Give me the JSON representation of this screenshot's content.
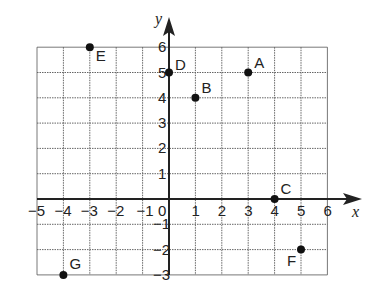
{
  "chart_data": {
    "type": "scatter",
    "title": "",
    "xlabel": "x",
    "ylabel": "y",
    "xlim": [
      -5,
      6
    ],
    "ylim": [
      -3,
      6
    ],
    "grid": true,
    "x_ticks": [
      "-5",
      "-4",
      "-3",
      "-2",
      "-1",
      "0",
      "1",
      "2",
      "3",
      "4",
      "5",
      "6"
    ],
    "y_ticks": [
      "6",
      "5",
      "4",
      "3",
      "2",
      "1",
      "-1",
      "-2",
      "-3"
    ],
    "points": [
      {
        "label": "A",
        "x": 3,
        "y": 5
      },
      {
        "label": "B",
        "x": 1,
        "y": 4
      },
      {
        "label": "C",
        "x": 4,
        "y": 0
      },
      {
        "label": "D",
        "x": 0,
        "y": 5
      },
      {
        "label": "E",
        "x": -3,
        "y": 6
      },
      {
        "label": "F",
        "x": 5,
        "y": -2
      },
      {
        "label": "G",
        "x": -4,
        "y": -3
      }
    ]
  }
}
